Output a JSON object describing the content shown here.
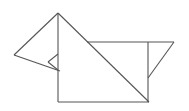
{
  "figure": {
    "width": 189,
    "height": 111,
    "background_color": "#ffffff",
    "stroke_color": "#555555",
    "stroke_width": 1.1,
    "vertices": {
      "apex": [
        58,
        13
      ],
      "left_tip": [
        14,
        55
      ],
      "notch_tip": [
        49,
        62
      ],
      "neck_left": [
        58,
        54
      ],
      "neck_lower": [
        58,
        70
      ],
      "back_start": [
        87,
        42
      ],
      "back_corner": [
        148,
        42
      ],
      "right_tip": [
        174,
        42
      ],
      "tail_join": [
        148,
        78
      ],
      "body_bottom_left": [
        58,
        102
      ],
      "body_bottom_right": [
        149,
        102
      ]
    },
    "edges": [
      {
        "name": "ear-left-upper",
        "points": "58,13 14,55"
      },
      {
        "name": "ear-left-lower",
        "points": "14,55 60,71"
      },
      {
        "name": "head-spine-vertical",
        "points": "58,13 58,102"
      },
      {
        "name": "head-diagonal-back",
        "points": "58,13 149,102"
      },
      {
        "name": "back-horizontal",
        "points": "87,42 174,42"
      },
      {
        "name": "tail-diagonal",
        "points": "174,42 148,78"
      },
      {
        "name": "tail-vertical",
        "points": "148,42 148,102"
      },
      {
        "name": "belly-horizontal",
        "points": "58,102 149,102"
      },
      {
        "name": "notch-upper",
        "points": "58,54 48,62"
      },
      {
        "name": "notch-lower",
        "points": "48,62 58,70"
      }
    ],
    "shape_count": 10,
    "line_style": "solid"
  }
}
